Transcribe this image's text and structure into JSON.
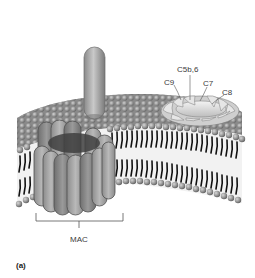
{
  "figure": {
    "panel_label": "(a)",
    "labels": {
      "c5b6": "C5b,6",
      "c9": "C9",
      "c7": "C7",
      "c8": "C8",
      "mac": "MAC"
    },
    "colors": {
      "background": "#ffffff",
      "headgroup": "#9a9a9a",
      "headgroup_shadow": "#5e5e5e",
      "tail": "#111111",
      "protein": "#a8a8a8",
      "protein_dark": "#7c7c7c",
      "protein_light": "#d9d9d9",
      "label_text": "#3a3a3a"
    }
  }
}
